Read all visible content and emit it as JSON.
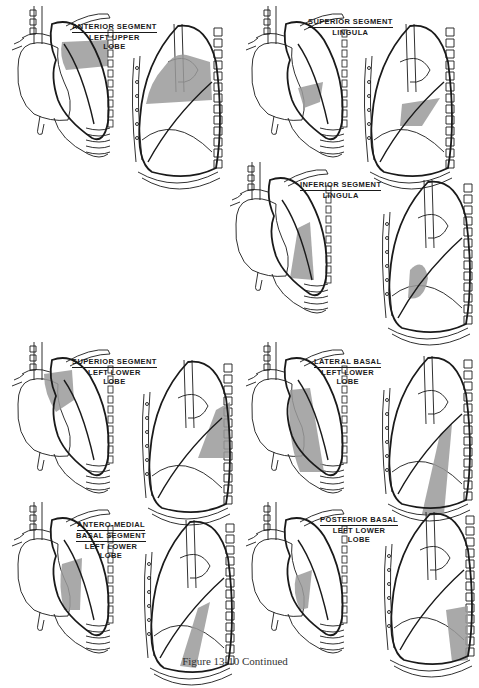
{
  "figure": {
    "caption": "Figure 13-10 Continued",
    "shade_color": "#9a9a9a",
    "line_color": "#1a1a1a",
    "panels": [
      {
        "id": "anterior-segment-lul",
        "title_lines": [
          "ANTERIOR SEGMENT"
        ],
        "sub_lines": [
          "LEFT UPPER",
          "LOBE"
        ]
      },
      {
        "id": "superior-segment-lingula",
        "title_lines": [
          "SUPERIOR SEGMENT"
        ],
        "sub_lines": [
          "LINGULA"
        ]
      },
      {
        "id": "inferior-segment-lingula",
        "title_lines": [
          "INFERIOR SEGMENT"
        ],
        "sub_lines": [
          "LINGULA"
        ]
      },
      {
        "id": "superior-segment-lll",
        "title_lines": [
          "SUPERIOR SEGMENT"
        ],
        "sub_lines": [
          "LEFT LOWER",
          "LOBE"
        ]
      },
      {
        "id": "lateral-basal-lll",
        "title_lines": [
          "LATERAL  BASAL"
        ],
        "sub_lines": [
          "LEFT LOWER",
          "LOBE"
        ]
      },
      {
        "id": "antero-medial-basal-lll",
        "title_lines": [
          "ANTERO-MEDIAL",
          "BASAL SEGMENT"
        ],
        "sub_lines": [
          "LEFT LOWER",
          "LOBE"
        ]
      },
      {
        "id": "posterior-basal-lll",
        "title_lines": [
          "POSTERIOR BASAL"
        ],
        "sub_lines": [
          "LEFT LOWER",
          "LOBE"
        ]
      }
    ]
  }
}
